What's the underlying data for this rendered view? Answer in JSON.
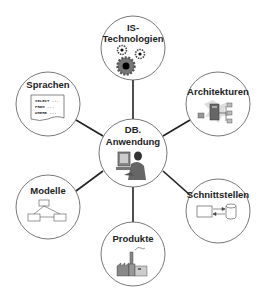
{
  "diagram": {
    "center": {
      "line1": "DB.",
      "line2": "Anwendung",
      "icon": "person-at-computer-icon"
    },
    "nodes": [
      {
        "id": "is-technologien",
        "line1": "IS-",
        "line2": "Technologien",
        "icon": "gears-icon"
      },
      {
        "id": "sprachen",
        "label": "Sprachen",
        "icon": "sql-document-icon",
        "sql_lines": [
          "SELECT ...",
          "FROM ...",
          "WHERE ..."
        ]
      },
      {
        "id": "architekturen",
        "label": "Architekturen",
        "icon": "server-network-icon"
      },
      {
        "id": "modelle",
        "label": "Modelle",
        "icon": "hierarchy-model-icon"
      },
      {
        "id": "schnittstellen",
        "label": "Schnittstellen",
        "icon": "interface-db-icon"
      },
      {
        "id": "produkte",
        "label": "Produkte",
        "icon": "factory-icon"
      }
    ],
    "colors": {
      "circle_stroke": "#555555",
      "connector": "#222222",
      "text": "#222222"
    }
  }
}
